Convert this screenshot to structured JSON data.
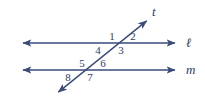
{
  "figure": {
    "kind": "geometry-diagram",
    "width": 205,
    "height": 99,
    "background_color": "#ffffff"
  },
  "colors": {
    "stroke": "#3a4a7a",
    "label_text": "#2e3c63"
  },
  "chart_data": {
    "type": "diagram",
    "title": "",
    "lines": [
      {
        "id": "line-l",
        "label": "ℓ",
        "orientation": "horizontal",
        "x1": 20,
        "y1": 43,
        "x2": 178,
        "y2": 43,
        "arrow_start": true,
        "arrow_end": true,
        "label_x": 186,
        "label_y": 43
      },
      {
        "id": "line-m",
        "label": "m",
        "orientation": "horizontal",
        "x1": 20,
        "y1": 70,
        "x2": 178,
        "y2": 70,
        "arrow_start": true,
        "arrow_end": true,
        "label_x": 186,
        "label_y": 70
      },
      {
        "id": "line-t",
        "label": "t",
        "orientation": "transversal",
        "x1": 56,
        "y1": 94,
        "x2": 149,
        "y2": 19,
        "arrow_start": true,
        "arrow_end": true,
        "label_x": 152,
        "label_y": 12
      }
    ],
    "intersections": [
      {
        "id": "upper",
        "lines": [
          "line-l",
          "line-t"
        ],
        "x": 114,
        "y": 43
      },
      {
        "id": "lower",
        "lines": [
          "line-m",
          "line-t"
        ],
        "x": 84,
        "y": 70
      }
    ],
    "angles": [
      {
        "number": "1",
        "x": 112,
        "y": 37,
        "position": "upper-intersection-upper-left"
      },
      {
        "number": "2",
        "x": 133,
        "y": 37,
        "position": "upper-intersection-upper-right"
      },
      {
        "number": "3",
        "x": 121,
        "y": 51,
        "position": "upper-intersection-lower-right"
      },
      {
        "number": "4",
        "x": 98,
        "y": 51,
        "position": "upper-intersection-lower-left"
      },
      {
        "number": "5",
        "x": 82,
        "y": 64,
        "position": "lower-intersection-upper-left"
      },
      {
        "number": "6",
        "x": 103,
        "y": 64,
        "position": "lower-intersection-upper-right"
      },
      {
        "number": "7",
        "x": 90,
        "y": 78,
        "position": "lower-intersection-lower-right"
      },
      {
        "number": "8",
        "x": 68,
        "y": 78,
        "position": "lower-intersection-lower-left"
      }
    ]
  }
}
